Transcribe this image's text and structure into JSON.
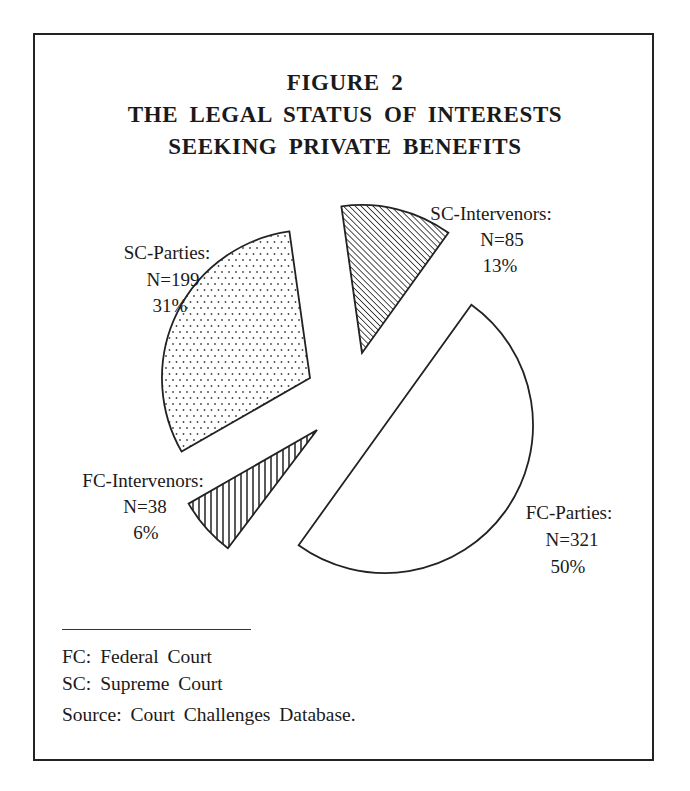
{
  "figure": {
    "number_label": "FIGURE 2",
    "title_lines": [
      "THE LEGAL STATUS OF INTERESTS",
      "SEEKING PRIVATE BENEFITS"
    ]
  },
  "footnotes": {
    "fc": "FC: Federal Court",
    "sc": "SC: Supreme Court",
    "source": "Source: Court Challenges Database."
  },
  "slices": [
    {
      "key": "fc_parties",
      "name": "FC-Parties:",
      "n": "N=321",
      "pct": "50%",
      "fill": "none"
    },
    {
      "key": "sc_intervenors",
      "name": "SC-Intervenors:",
      "n": "N=85",
      "pct": "13%",
      "fill": "diagonal-hatch"
    },
    {
      "key": "sc_parties",
      "name": "SC-Parties:",
      "n": "N=199",
      "pct": "31%",
      "fill": "dots"
    },
    {
      "key": "fc_intervenors",
      "name": "FC-Intervenors:",
      "n": "N=38",
      "pct": "6%",
      "fill": "vertical-hatch"
    }
  ],
  "chart_data": {
    "type": "pie",
    "exploded": true,
    "categories": [
      "FC-Parties",
      "SC-Intervenors",
      "SC-Parties",
      "FC-Intervenors"
    ],
    "values": [
      321,
      85,
      199,
      38
    ],
    "percentages": [
      50,
      13,
      31,
      6
    ],
    "total": 643,
    "legend": {
      "FC": "Federal Court",
      "SC": "Supreme Court"
    },
    "source": "Court Challenges Database",
    "fills": [
      "white",
      "diagonal hatch",
      "dotted",
      "vertical hatch"
    ]
  },
  "geometry": {
    "radius": 148,
    "slices": [
      {
        "cx": 385,
        "cy": 425,
        "start": 54.3,
        "end": -125.7
      },
      {
        "cx": 362,
        "cy": 353,
        "start": 98.0,
        "end": 54.3
      },
      {
        "cx": 310,
        "cy": 378,
        "start": 209.8,
        "end": 98.0
      },
      {
        "cx": 317,
        "cy": 430,
        "start": 233.0,
        "end": 209.8
      }
    ]
  }
}
